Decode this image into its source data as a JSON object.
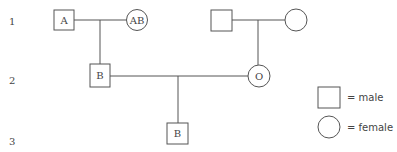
{
  "generations": [
    "1",
    "2",
    "3"
  ],
  "individuals": {
    "gen1_male_left": {
      "sex": "male",
      "label": "A"
    },
    "gen1_female_left": {
      "sex": "female",
      "label": "AB"
    },
    "gen1_male_right": {
      "sex": "male",
      "label": ""
    },
    "gen1_female_right": {
      "sex": "female",
      "label": ""
    },
    "gen2_male": {
      "sex": "male",
      "label": "B"
    },
    "gen2_female": {
      "sex": "female",
      "label": "O"
    },
    "gen3_male": {
      "sex": "male",
      "label": "B"
    }
  },
  "legend": {
    "male": "= male",
    "female": "= female"
  }
}
